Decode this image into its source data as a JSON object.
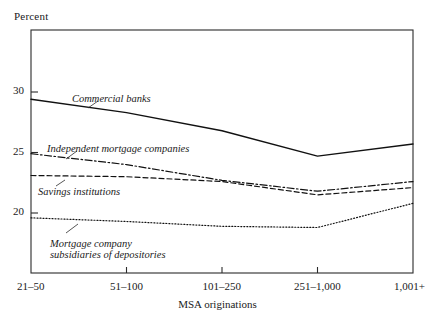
{
  "chart_data": {
    "type": "line",
    "title": "",
    "ylabel": "Percent",
    "xlabel": "MSA originations",
    "categories": [
      "21–50",
      "51–100",
      "101–250",
      "251–1,000",
      "1,001+"
    ],
    "ytick_labels": [
      "30",
      "25",
      "20"
    ],
    "ytick_values": [
      30,
      25,
      20
    ],
    "ylim": [
      16.0,
      32.0
    ],
    "grid": false,
    "legend_position": "inline-annotations",
    "series": [
      {
        "name": "Commercial banks",
        "style": "solid",
        "values": [
          29.4,
          28.3,
          26.8,
          24.7,
          25.7
        ]
      },
      {
        "name": "Independent mortgage companies",
        "style": "dash-dot",
        "values": [
          24.9,
          24.0,
          22.7,
          21.8,
          22.6
        ]
      },
      {
        "name": "Savings institutions",
        "style": "dashed",
        "values": [
          23.1,
          23.0,
          22.6,
          21.5,
          22.1
        ]
      },
      {
        "name": "Mortgage company subsidiaries of depositories",
        "style": "dotted",
        "values": [
          19.6,
          19.3,
          18.9,
          18.8,
          20.8
        ]
      }
    ],
    "annotations": [
      {
        "text": "Commercial banks",
        "x": 72,
        "y": 93
      },
      {
        "text": "Independent mortgage companies",
        "x": 47,
        "y": 143
      },
      {
        "text": "Savings institutions",
        "x": 38,
        "y": 186
      },
      {
        "text": "Mortgage company",
        "x": 50,
        "y": 238
      },
      {
        "text": "subsidiaries of depositories",
        "x": 50,
        "y": 249
      }
    ],
    "colors": {
      "axis": "#2b2b2b",
      "line": "#111111",
      "background": "#ffffff"
    }
  }
}
